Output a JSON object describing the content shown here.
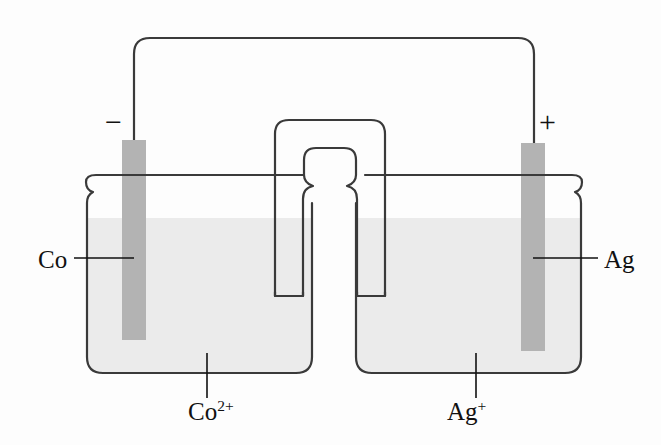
{
  "figure": {
    "kind": "galvanic-cell-diagram",
    "background_color": "#fdfdfd",
    "line_color": "#3a3a3a",
    "electrode_color": "#b0b0b0",
    "solution_color": "#ebebeb"
  },
  "labels": {
    "left_electrode": "Co",
    "right_electrode": "Ag",
    "left_solution": "Co",
    "left_solution_charge": "2+",
    "right_solution": "Ag",
    "right_solution_charge": "+",
    "negative_terminal": "−",
    "positive_terminal": "+"
  },
  "components": {
    "wire": "external-circuit-wire",
    "salt_bridge": "salt-bridge",
    "left_beaker": "left-beaker",
    "right_beaker": "right-beaker",
    "left_electrode_bar": "cobalt-electrode",
    "right_electrode_bar": "silver-electrode",
    "left_solution_fill": "cobalt-ion-solution",
    "right_solution_fill": "silver-ion-solution",
    "left_leader": "co-leader-line",
    "right_leader": "ag-leader-line",
    "left_solution_leader": "co-ion-leader-line",
    "right_solution_leader": "ag-ion-leader-line"
  },
  "geometry": {
    "width": 661,
    "height": 445,
    "liquid_level_y": 218,
    "beaker_rim_y": 175,
    "beaker_bottom_y": 375,
    "left_beaker_x": [
      86,
      313
    ],
    "right_beaker_x": [
      355,
      582
    ],
    "left_electrode_x": [
      122,
      146
    ],
    "right_electrode_x": [
      521,
      545
    ],
    "electrode_top_y": 140,
    "left_electrode_bottom_y": 340,
    "right_electrode_bottom_y": 350,
    "wire_top_y": 38,
    "salt_bridge_outer_top_y": 120,
    "salt_bridge_inner_top_y": 148,
    "salt_bridge_leg_bottom_y": 296
  }
}
